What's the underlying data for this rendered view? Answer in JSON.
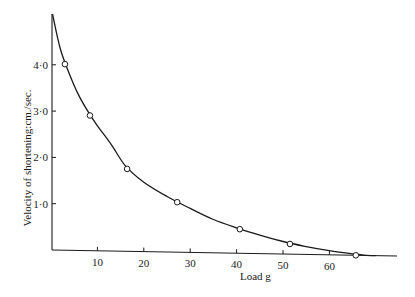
{
  "chart_data": {
    "type": "scatter",
    "title": "",
    "xlabel": "Load g",
    "ylabel": "Velocity of shortening:cm./sec.",
    "xlim": [
      0,
      75
    ],
    "ylim": [
      0,
      5.1
    ],
    "grid": false,
    "legend": null,
    "x_ticks": [
      10,
      20,
      30,
      40,
      50,
      60
    ],
    "x_tick_labels": [
      "10",
      "20",
      "30",
      "40",
      "50",
      "60"
    ],
    "y_ticks": [
      1.0,
      2.0,
      3.0,
      4.0
    ],
    "y_tick_labels": [
      "1·0",
      "2·0",
      "3·0",
      "4·0"
    ],
    "series": [
      {
        "name": "observed",
        "marker": "open-circle",
        "x": [
          3.0,
          8.4,
          16.4,
          27.2,
          40.7,
          51.5,
          65.7
        ],
        "y": [
          4.02,
          2.92,
          1.78,
          1.08,
          0.52,
          0.22,
          0.0
        ]
      },
      {
        "name": "fitted curve",
        "style": "line",
        "x": [
          0,
          2,
          4,
          6,
          8,
          10,
          13,
          16,
          20,
          25,
          30,
          35,
          40,
          45,
          50,
          55,
          60,
          65,
          68,
          70
        ],
        "y": [
          5.1,
          4.35,
          3.8,
          3.35,
          3.0,
          2.7,
          2.3,
          1.85,
          1.5,
          1.2,
          0.95,
          0.72,
          0.55,
          0.4,
          0.27,
          0.17,
          0.09,
          0.03,
          0.005,
          0.0
        ]
      }
    ]
  }
}
